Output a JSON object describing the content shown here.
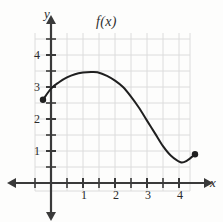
{
  "chart_data": {
    "type": "line",
    "title": "f(x)",
    "xlabel": "x",
    "ylabel": "y",
    "xlim": [
      -0.55,
      4.9
    ],
    "ylim": [
      -0.55,
      4.85
    ],
    "grid": true,
    "legend": null,
    "x_ticks_labeled": [
      1,
      2,
      3,
      4
    ],
    "y_ticks_labeled": [
      1,
      2,
      3,
      4
    ],
    "x_ticks_minor": [
      0.5,
      1.5,
      2.5,
      3.5,
      4.5
    ],
    "y_ticks_minor": [
      0.5,
      1.5,
      2.5,
      3.5,
      4.5
    ],
    "x_tick_labels": [
      "1",
      "2",
      "3",
      "4"
    ],
    "y_tick_labels": [
      "1",
      "2",
      "3",
      "4"
    ],
    "series": [
      {
        "name": "f(x)",
        "color": "#1f1f1f",
        "endpoints_filled": true,
        "x": [
          -0.25,
          0.0,
          0.25,
          0.5,
          0.75,
          1.0,
          1.25,
          1.45,
          1.75,
          2.0,
          2.25,
          2.5,
          2.75,
          3.0,
          3.25,
          3.5,
          3.75,
          4.05,
          4.25,
          4.5
        ],
        "y": [
          2.6,
          2.95,
          3.15,
          3.3,
          3.4,
          3.45,
          3.47,
          3.46,
          3.35,
          3.2,
          3.0,
          2.7,
          2.35,
          1.95,
          1.55,
          1.15,
          0.85,
          0.65,
          0.7,
          0.9
        ]
      }
    ],
    "annotations": [
      {
        "name": "left-endpoint",
        "x": -0.25,
        "y": 2.6,
        "marker": "filled-circle"
      },
      {
        "name": "right-endpoint",
        "x": 4.5,
        "y": 0.9,
        "marker": "filled-circle"
      },
      {
        "name": "local-maximum",
        "x": 1.45,
        "y": 3.47
      },
      {
        "name": "local-minimum",
        "x": 4.05,
        "y": 0.65
      }
    ]
  },
  "colors": {
    "curve": "#1f1f1f",
    "axis": "#3a3a3a",
    "grid": "#d8d8d8",
    "background": "#fdfdfc",
    "text": "#2a2a2a"
  }
}
